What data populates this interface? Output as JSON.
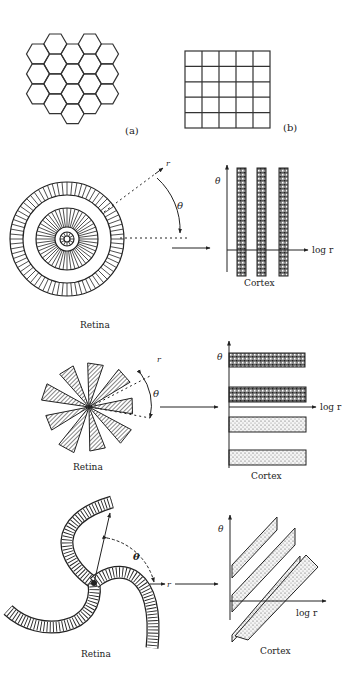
{
  "figure": {
    "panel_a_label": "(a)",
    "panel_b_label": "(b)",
    "mappings": [
      {
        "id": "concentric-rings",
        "retina_label": "Retina",
        "cortex_label": "Cortex",
        "theta_label": "θ",
        "r_label": "r",
        "log_r_label": "log r",
        "description": "Concentric rings on retina map to vertical stripes in cortex"
      },
      {
        "id": "radial-wedges",
        "retina_label": "Retina",
        "cortex_label": "Cortex",
        "theta_label": "θ",
        "r_label": "r",
        "log_r_label": "log r",
        "description": "Radial wedges on retina map to horizontal stripes in cortex"
      },
      {
        "id": "spirals",
        "retina_label": "Retina",
        "cortex_label": "Cortex",
        "theta_label": "θ",
        "r_label": "r",
        "log_r_label": "log r",
        "description": "Logarithmic spirals on retina map to diagonal stripes in cortex"
      }
    ]
  },
  "colors": {
    "ink": "#222222",
    "background": "#ffffff"
  }
}
